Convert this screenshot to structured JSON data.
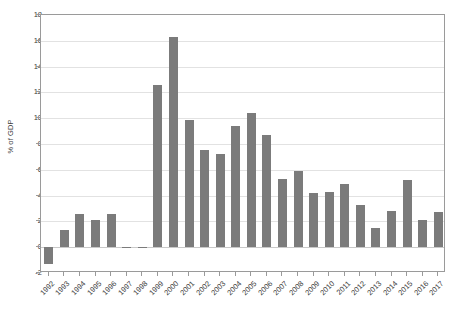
{
  "chart_data": {
    "type": "bar",
    "title": "",
    "xlabel": "",
    "ylabel": "% of GDP",
    "ylim": [
      -2,
      18
    ],
    "ytick_values": [
      -2,
      0,
      2,
      4,
      6,
      8,
      10,
      12,
      14,
      16,
      18
    ],
    "ytick_labels": [
      "-2",
      "0",
      "2",
      "4",
      "6",
      "8",
      "10",
      "12",
      "14",
      "16",
      "18"
    ],
    "grid": true,
    "legend": "none",
    "bar_color": "#7b7b7b",
    "categories": [
      "1992",
      "1993",
      "1994",
      "1995",
      "1996",
      "1997",
      "1998",
      "1999",
      "2000",
      "2001",
      "2002",
      "2003",
      "2004",
      "2005",
      "2006",
      "2007",
      "2008",
      "2009",
      "2010",
      "2011",
      "2012",
      "2013",
      "2014",
      "2015",
      "2016",
      "2017"
    ],
    "values": [
      -1.3,
      1.35,
      2.6,
      2.1,
      2.55,
      0.05,
      0.05,
      12.6,
      16.3,
      9.9,
      7.5,
      7.2,
      9.4,
      10.4,
      8.7,
      5.3,
      5.9,
      4.2,
      4.3,
      4.9,
      3.3,
      1.5,
      2.8,
      5.2,
      2.1,
      2.7
    ]
  }
}
